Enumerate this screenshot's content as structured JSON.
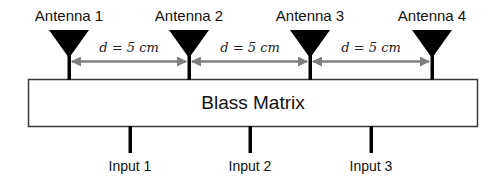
{
  "diagram": {
    "colors": {
      "antenna": "#000000",
      "arrow": "#7f7f7f",
      "box_border": "#3a3a3a",
      "box_fill": "#ffffff"
    },
    "antennas": [
      {
        "label": "Antenna 1",
        "x": 69
      },
      {
        "label": "Antenna 2",
        "x": 189
      },
      {
        "label": "Antenna 3",
        "x": 310
      },
      {
        "label": "Antenna 4",
        "x": 432
      }
    ],
    "spacings": [
      {
        "label": "d = 5 cm",
        "x": 129
      },
      {
        "label": "d = 5 cm",
        "x": 250
      },
      {
        "label": "d = 5 cm",
        "x": 371
      }
    ],
    "matrix": {
      "label": "Blass Matrix"
    },
    "inputs": [
      {
        "label": "Input 1",
        "x": 130
      },
      {
        "label": "Input 2",
        "x": 250
      },
      {
        "label": "Input 3",
        "x": 371
      }
    ]
  }
}
